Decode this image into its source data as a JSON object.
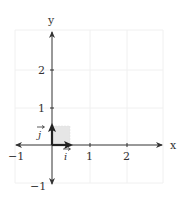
{
  "diagram": {
    "type": "coordinate-plane",
    "x_axis_label": "x",
    "y_axis_label": "y",
    "x_range": [
      -1,
      3
    ],
    "y_range": [
      -1,
      3
    ],
    "x_ticks": [
      {
        "value": -1,
        "label": "−1"
      },
      {
        "value": 1,
        "label": "1"
      },
      {
        "value": 2,
        "label": "2"
      }
    ],
    "y_ticks": [
      {
        "value": -1,
        "label": "−1"
      },
      {
        "value": 1,
        "label": "1"
      },
      {
        "value": 2,
        "label": "2"
      }
    ],
    "vectors": [
      {
        "name": "i",
        "label": "i",
        "from": [
          0,
          0
        ],
        "to": [
          0.5,
          0
        ]
      },
      {
        "name": "j",
        "label": "j",
        "from": [
          0,
          0
        ],
        "to": [
          0,
          0.5
        ]
      }
    ],
    "shaded_region": {
      "from": [
        0,
        0
      ],
      "to": [
        0.5,
        0.5
      ],
      "color": "#e6e6e6"
    },
    "colors": {
      "axis": "#333333",
      "grid": "#f0f0f0",
      "vector": "#222222"
    }
  }
}
